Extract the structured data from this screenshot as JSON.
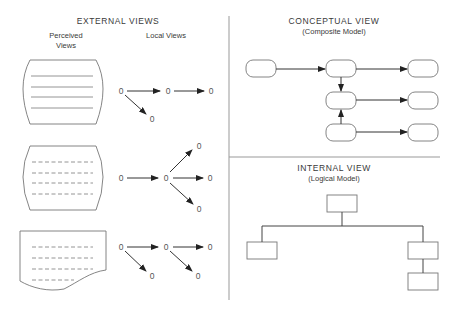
{
  "external": {
    "title": "EXTERNAL VIEWS",
    "perceived_label_1": "Perceived",
    "perceived_label_2": "Views",
    "local_label": "Local Views",
    "node_label": "0",
    "perceived_views": [
      {
        "shape": "screen",
        "line_style": "solid",
        "lines": 4
      },
      {
        "shape": "screen",
        "line_style": "dashed",
        "lines": 4
      },
      {
        "shape": "document",
        "line_style": "dashed",
        "lines": 4
      }
    ],
    "local_views": [
      {
        "nodes": [
          "0",
          "0",
          "0",
          "0"
        ],
        "edges": [
          [
            0,
            1
          ],
          [
            1,
            2
          ],
          [
            0,
            3
          ]
        ]
      },
      {
        "nodes": [
          "0",
          "0",
          "0",
          "0",
          "0"
        ],
        "edges": [
          [
            0,
            1
          ],
          [
            1,
            2
          ],
          [
            1,
            3
          ],
          [
            1,
            4
          ]
        ]
      },
      {
        "nodes": [
          "0",
          "0",
          "0",
          "0",
          "0"
        ],
        "edges": [
          [
            0,
            1
          ],
          [
            1,
            2
          ],
          [
            0,
            3
          ],
          [
            1,
            4
          ]
        ]
      }
    ]
  },
  "conceptual": {
    "title": "CONCEPTUAL VIEW",
    "subtitle": "(Composite Model)",
    "node_count": 7,
    "edges": [
      [
        0,
        1
      ],
      [
        1,
        4
      ],
      [
        1,
        2
      ],
      [
        2,
        5
      ],
      [
        3,
        2
      ],
      [
        3,
        6
      ]
    ]
  },
  "internal": {
    "title": "INTERNAL VIEW",
    "subtitle": "(Logical Model)",
    "node_count": 4,
    "edges": [
      [
        0,
        1
      ],
      [
        0,
        2
      ],
      [
        2,
        3
      ]
    ]
  }
}
